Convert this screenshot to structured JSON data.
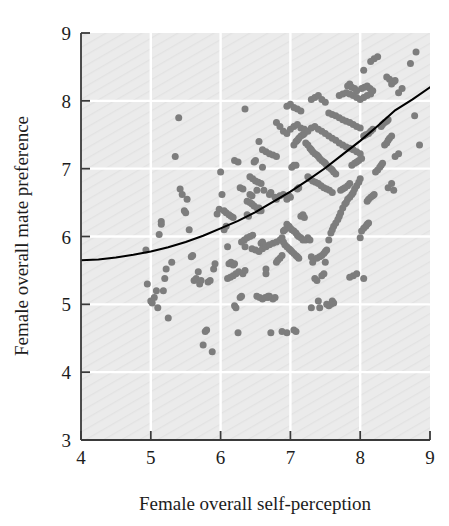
{
  "chart_data": {
    "type": "scatter",
    "title": "",
    "subtitle": "",
    "xlabel": "Female overall self-perception",
    "ylabel": "Female overall mate preference",
    "xlim": [
      4,
      9
    ],
    "ylim": [
      3,
      9
    ],
    "xticks": [
      4,
      5,
      6,
      7,
      8,
      9
    ],
    "yticks": [
      3,
      4,
      5,
      6,
      7,
      8,
      9
    ],
    "xticklabels": [
      "4",
      "5",
      "6",
      "7",
      "8",
      "9"
    ],
    "yticklabels": [
      "3",
      "4",
      "5",
      "6",
      "7",
      "8",
      "9"
    ],
    "grid": true,
    "grid_color": "#ffffff",
    "plot_background": "#ebebeb",
    "legend": null,
    "legend_position": "none",
    "marker_color": "#7d7d7d",
    "marker_size": 7,
    "marker_shape": "circle",
    "fit_line": {
      "name": "quadratic regression fit",
      "color": "#000000",
      "width": 2.1,
      "x": [
        4.0,
        4.25,
        4.5,
        4.75,
        5.0,
        5.25,
        5.5,
        5.75,
        6.0,
        6.25,
        6.5,
        6.75,
        7.0,
        7.25,
        7.5,
        7.75,
        8.0,
        8.25,
        8.5,
        8.75,
        9.0
      ],
      "y": [
        5.65,
        5.66,
        5.69,
        5.73,
        5.78,
        5.84,
        5.92,
        6.01,
        6.12,
        6.23,
        6.36,
        6.51,
        6.66,
        6.83,
        7.01,
        7.21,
        7.41,
        7.63,
        7.86,
        8.02,
        8.2
      ]
    },
    "points": [
      [
        4.93,
        5.8
      ],
      [
        4.95,
        5.3
      ],
      [
        5.0,
        5.05
      ],
      [
        5.02,
        5.02
      ],
      [
        5.05,
        5.1
      ],
      [
        5.08,
        5.2
      ],
      [
        5.1,
        4.95
      ],
      [
        5.12,
        6.03
      ],
      [
        5.15,
        6.22
      ],
      [
        5.15,
        6.18
      ],
      [
        5.18,
        5.2
      ],
      [
        5.2,
        5.38
      ],
      [
        5.22,
        5.52
      ],
      [
        5.25,
        4.8
      ],
      [
        5.3,
        5.62
      ],
      [
        5.35,
        7.18
      ],
      [
        5.4,
        7.75
      ],
      [
        5.42,
        6.7
      ],
      [
        5.45,
        6.62
      ],
      [
        5.48,
        6.38
      ],
      [
        5.5,
        6.35
      ],
      [
        5.52,
        6.55
      ],
      [
        5.55,
        6.1
      ],
      [
        5.58,
        5.7
      ],
      [
        5.6,
        5.72
      ],
      [
        5.62,
        5.35
      ],
      [
        5.65,
        5.38
      ],
      [
        5.68,
        5.48
      ],
      [
        5.7,
        5.3
      ],
      [
        5.72,
        5.35
      ],
      [
        5.75,
        4.4
      ],
      [
        5.78,
        4.6
      ],
      [
        5.8,
        4.62
      ],
      [
        5.82,
        5.33
      ],
      [
        5.85,
        5.35
      ],
      [
        5.88,
        4.3
      ],
      [
        5.9,
        5.52
      ],
      [
        5.92,
        5.6
      ],
      [
        5.95,
        6.33
      ],
      [
        5.98,
        6.4
      ],
      [
        6.0,
        6.95
      ],
      [
        6.02,
        6.62
      ],
      [
        6.05,
        6.1
      ],
      [
        6.08,
        6.15
      ],
      [
        6.1,
        5.85
      ],
      [
        6.12,
        5.6
      ],
      [
        6.15,
        5.62
      ],
      [
        6.18,
        5.58
      ],
      [
        6.2,
        5.6
      ],
      [
        6.2,
        4.98
      ],
      [
        6.22,
        4.95
      ],
      [
        6.25,
        4.58
      ],
      [
        6.28,
        5.1
      ],
      [
        6.3,
        5.12
      ],
      [
        6.32,
        5.45
      ],
      [
        6.35,
        5.5
      ],
      [
        6.35,
        5.85
      ],
      [
        6.38,
        6.32
      ],
      [
        6.4,
        6.3
      ],
      [
        6.42,
        6.62
      ],
      [
        6.45,
        6.6
      ],
      [
        6.48,
        7.1
      ],
      [
        6.5,
        7.12
      ],
      [
        6.52,
        6.68
      ],
      [
        6.55,
        6.38
      ],
      [
        6.55,
        6.42
      ],
      [
        6.58,
        5.9
      ],
      [
        6.6,
        5.92
      ],
      [
        6.62,
        5.88
      ],
      [
        6.65,
        5.52
      ],
      [
        6.65,
        5.45
      ],
      [
        6.68,
        5.1
      ],
      [
        6.7,
        5.12
      ],
      [
        6.72,
        4.58
      ],
      [
        6.75,
        5.08
      ],
      [
        6.78,
        5.1
      ],
      [
        6.8,
        5.62
      ],
      [
        6.82,
        5.65
      ],
      [
        6.85,
        5.68
      ],
      [
        6.88,
        5.72
      ],
      [
        6.9,
        6.08
      ],
      [
        6.92,
        6.1
      ],
      [
        6.95,
        6.55
      ],
      [
        6.98,
        6.6
      ],
      [
        7.0,
        6.58
      ],
      [
        7.02,
        7.02
      ],
      [
        7.05,
        7.05
      ],
      [
        7.08,
        7.05
      ],
      [
        7.1,
        6.7
      ],
      [
        7.12,
        6.72
      ],
      [
        7.15,
        6.3
      ],
      [
        7.18,
        6.32
      ],
      [
        7.2,
        6.28
      ],
      [
        7.22,
        5.95
      ],
      [
        7.25,
        5.98
      ],
      [
        7.28,
        5.95
      ],
      [
        7.3,
        5.7
      ],
      [
        7.32,
        5.62
      ],
      [
        7.35,
        5.38
      ],
      [
        7.38,
        5.35
      ],
      [
        7.4,
        5.05
      ],
      [
        7.42,
        4.95
      ],
      [
        7.45,
        5.42
      ],
      [
        7.48,
        5.45
      ],
      [
        7.5,
        5.62
      ],
      [
        7.52,
        5.8
      ],
      [
        7.55,
        5.95
      ],
      [
        7.58,
        6.05
      ],
      [
        7.6,
        6.1
      ],
      [
        7.62,
        6.15
      ],
      [
        7.65,
        6.2
      ],
      [
        7.68,
        6.25
      ],
      [
        7.7,
        6.3
      ],
      [
        7.72,
        6.35
      ],
      [
        7.75,
        6.42
      ],
      [
        7.78,
        6.48
      ],
      [
        7.8,
        6.5
      ],
      [
        7.82,
        6.55
      ],
      [
        7.85,
        6.58
      ],
      [
        7.88,
        6.62
      ],
      [
        7.9,
        6.65
      ],
      [
        7.92,
        6.7
      ],
      [
        7.95,
        6.75
      ],
      [
        7.98,
        6.8
      ],
      [
        8.0,
        6.85
      ],
      [
        7.05,
        7.35
      ],
      [
        7.08,
        7.4
      ],
      [
        7.1,
        7.42
      ],
      [
        7.12,
        7.45
      ],
      [
        7.15,
        7.48
      ],
      [
        7.18,
        7.5
      ],
      [
        7.2,
        7.52
      ],
      [
        7.22,
        7.38
      ],
      [
        7.25,
        7.35
      ],
      [
        7.28,
        7.3
      ],
      [
        7.3,
        7.28
      ],
      [
        7.32,
        7.25
      ],
      [
        7.35,
        7.22
      ],
      [
        7.38,
        7.2
      ],
      [
        7.4,
        7.18
      ],
      [
        7.42,
        7.15
      ],
      [
        7.45,
        7.12
      ],
      [
        7.48,
        7.1
      ],
      [
        7.5,
        7.08
      ],
      [
        7.52,
        7.05
      ],
      [
        7.55,
        7.02
      ],
      [
        7.58,
        7.0
      ],
      [
        7.6,
        6.98
      ],
      [
        7.62,
        6.95
      ],
      [
        7.65,
        6.92
      ],
      [
        6.8,
        7.68
      ],
      [
        6.85,
        7.62
      ],
      [
        6.9,
        7.55
      ],
      [
        6.95,
        7.52
      ],
      [
        7.0,
        7.58
      ],
      [
        7.05,
        7.62
      ],
      [
        7.1,
        7.65
      ],
      [
        7.15,
        7.6
      ],
      [
        7.2,
        7.58
      ],
      [
        7.25,
        7.55
      ],
      [
        7.3,
        7.6
      ],
      [
        7.35,
        7.62
      ],
      [
        7.4,
        7.58
      ],
      [
        7.45,
        7.55
      ],
      [
        7.5,
        7.52
      ],
      [
        7.55,
        7.48
      ],
      [
        7.6,
        7.45
      ],
      [
        7.65,
        7.42
      ],
      [
        7.7,
        7.38
      ],
      [
        7.75,
        7.35
      ],
      [
        7.8,
        7.32
      ],
      [
        7.85,
        7.3
      ],
      [
        7.9,
        7.28
      ],
      [
        7.95,
        7.25
      ],
      [
        8.0,
        7.22
      ],
      [
        7.55,
        7.82
      ],
      [
        7.6,
        7.8
      ],
      [
        7.65,
        7.78
      ],
      [
        7.7,
        7.75
      ],
      [
        7.75,
        7.72
      ],
      [
        7.8,
        7.7
      ],
      [
        7.85,
        7.68
      ],
      [
        7.9,
        7.65
      ],
      [
        7.95,
        7.62
      ],
      [
        8.0,
        7.6
      ],
      [
        7.7,
        8.08
      ],
      [
        7.75,
        8.1
      ],
      [
        7.8,
        8.12
      ],
      [
        7.85,
        8.1
      ],
      [
        7.9,
        8.08
      ],
      [
        7.95,
        8.05
      ],
      [
        8.0,
        8.02
      ],
      [
        8.05,
        8.05
      ],
      [
        8.1,
        8.08
      ],
      [
        8.15,
        8.1
      ],
      [
        6.35,
        7.88
      ],
      [
        6.55,
        7.4
      ],
      [
        6.6,
        7.02
      ],
      [
        6.62,
        6.68
      ],
      [
        6.7,
        6.62
      ],
      [
        6.72,
        6.65
      ],
      [
        6.78,
        6.58
      ],
      [
        6.8,
        6.55
      ],
      [
        6.85,
        6.6
      ],
      [
        6.9,
        6.62
      ],
      [
        6.2,
        7.12
      ],
      [
        6.25,
        7.1
      ],
      [
        6.28,
        6.72
      ],
      [
        6.32,
        6.7
      ],
      [
        6.38,
        6.52
      ],
      [
        6.42,
        6.5
      ],
      [
        6.45,
        6.48
      ],
      [
        6.48,
        6.45
      ],
      [
        6.52,
        6.42
      ],
      [
        6.58,
        6.38
      ],
      [
        6.05,
        6.38
      ],
      [
        6.08,
        6.35
      ],
      [
        6.12,
        6.32
      ],
      [
        6.15,
        6.3
      ],
      [
        6.18,
        6.28
      ],
      [
        6.9,
        5.92
      ],
      [
        6.92,
        5.88
      ],
      [
        6.95,
        5.85
      ],
      [
        6.98,
        5.82
      ],
      [
        7.0,
        5.8
      ],
      [
        7.02,
        5.78
      ],
      [
        7.05,
        5.75
      ],
      [
        7.08,
        5.72
      ],
      [
        7.1,
        5.7
      ],
      [
        7.12,
        5.68
      ],
      [
        6.95,
        6.18
      ],
      [
        6.98,
        6.15
      ],
      [
        7.0,
        6.12
      ],
      [
        7.02,
        6.1
      ],
      [
        7.05,
        6.08
      ],
      [
        7.08,
        6.05
      ],
      [
        7.1,
        6.02
      ],
      [
        7.12,
        6.0
      ],
      [
        7.15,
        5.98
      ],
      [
        7.18,
        5.95
      ],
      [
        8.02,
        6.08
      ],
      [
        8.05,
        6.12
      ],
      [
        8.08,
        6.15
      ],
      [
        8.1,
        6.18
      ],
      [
        8.12,
        6.2
      ],
      [
        8.0,
        5.98
      ],
      [
        8.05,
        5.38
      ],
      [
        7.9,
        5.42
      ],
      [
        7.85,
        5.4
      ],
      [
        7.95,
        5.45
      ],
      [
        8.1,
        6.52
      ],
      [
        8.12,
        6.55
      ],
      [
        8.15,
        6.58
      ],
      [
        8.18,
        6.6
      ],
      [
        8.2,
        6.62
      ],
      [
        8.22,
        6.95
      ],
      [
        8.25,
        6.98
      ],
      [
        8.28,
        7.02
      ],
      [
        8.3,
        7.05
      ],
      [
        8.32,
        7.08
      ],
      [
        8.35,
        7.35
      ],
      [
        8.38,
        7.38
      ],
      [
        8.4,
        7.42
      ],
      [
        8.42,
        7.45
      ],
      [
        8.45,
        7.48
      ],
      [
        8.3,
        7.62
      ],
      [
        8.32,
        7.65
      ],
      [
        8.35,
        7.68
      ],
      [
        8.38,
        7.7
      ],
      [
        8.4,
        7.72
      ],
      [
        8.45,
        8.25
      ],
      [
        8.48,
        8.28
      ],
      [
        8.5,
        8.3
      ],
      [
        8.42,
        8.32
      ],
      [
        8.38,
        8.35
      ],
      [
        8.2,
        8.62
      ],
      [
        8.25,
        8.65
      ],
      [
        8.15,
        8.58
      ],
      [
        8.05,
        8.45
      ],
      [
        8.8,
        8.72
      ],
      [
        8.72,
        8.55
      ],
      [
        8.78,
        7.78
      ],
      [
        8.85,
        7.35
      ],
      [
        8.6,
        8.18
      ],
      [
        8.55,
        8.12
      ],
      [
        7.3,
        8.02
      ],
      [
        7.35,
        8.05
      ],
      [
        7.4,
        8.08
      ],
      [
        7.45,
        8.02
      ],
      [
        7.5,
        7.98
      ],
      [
        6.95,
        7.92
      ],
      [
        7.0,
        7.95
      ],
      [
        7.05,
        7.9
      ],
      [
        7.1,
        7.88
      ],
      [
        7.15,
        7.85
      ],
      [
        7.82,
        8.22
      ],
      [
        7.85,
        8.25
      ],
      [
        7.88,
        8.2
      ],
      [
        7.92,
        8.18
      ],
      [
        7.95,
        8.15
      ],
      [
        8.02,
        8.18
      ],
      [
        8.06,
        8.2
      ],
      [
        8.1,
        8.22
      ],
      [
        8.14,
        8.18
      ],
      [
        8.18,
        8.15
      ],
      [
        6.45,
        5.82
      ],
      [
        6.5,
        5.8
      ],
      [
        6.55,
        5.78
      ],
      [
        6.6,
        5.82
      ],
      [
        6.65,
        5.85
      ],
      [
        6.7,
        5.88
      ],
      [
        6.75,
        5.9
      ],
      [
        6.8,
        5.92
      ],
      [
        6.85,
        5.95
      ],
      [
        6.88,
        5.98
      ],
      [
        6.3,
        5.92
      ],
      [
        6.34,
        5.95
      ],
      [
        6.38,
        5.98
      ],
      [
        6.42,
        6.0
      ],
      [
        6.46,
        6.02
      ],
      [
        6.1,
        5.38
      ],
      [
        6.14,
        5.4
      ],
      [
        6.18,
        5.42
      ],
      [
        6.22,
        5.45
      ],
      [
        6.26,
        5.48
      ],
      [
        6.52,
        5.12
      ],
      [
        6.56,
        5.1
      ],
      [
        6.6,
        5.08
      ],
      [
        6.64,
        5.1
      ],
      [
        6.68,
        5.12
      ],
      [
        7.6,
        5.05
      ],
      [
        7.62,
        5.02
      ],
      [
        7.58,
        5.0
      ],
      [
        7.55,
        4.98
      ],
      [
        7.52,
        5.0
      ],
      [
        7.3,
        4.95
      ],
      [
        7.05,
        4.62
      ],
      [
        7.08,
        4.6
      ],
      [
        6.95,
        4.58
      ],
      [
        6.88,
        4.6
      ],
      [
        7.72,
        6.68
      ],
      [
        7.75,
        6.7
      ],
      [
        7.78,
        6.72
      ],
      [
        7.82,
        6.75
      ],
      [
        7.85,
        6.78
      ],
      [
        7.88,
        7.05
      ],
      [
        7.92,
        7.08
      ],
      [
        7.95,
        7.1
      ],
      [
        7.98,
        7.12
      ],
      [
        8.02,
        7.15
      ],
      [
        8.05,
        7.48
      ],
      [
        8.08,
        7.5
      ],
      [
        8.12,
        7.52
      ],
      [
        8.15,
        7.55
      ],
      [
        8.18,
        7.58
      ],
      [
        7.25,
        6.88
      ],
      [
        7.28,
        6.85
      ],
      [
        7.32,
        6.82
      ],
      [
        7.36,
        6.8
      ],
      [
        7.4,
        6.78
      ],
      [
        7.44,
        6.75
      ],
      [
        7.48,
        6.72
      ],
      [
        7.52,
        6.7
      ],
      [
        7.56,
        6.68
      ],
      [
        7.6,
        6.65
      ],
      [
        6.6,
        7.28
      ],
      [
        6.65,
        7.25
      ],
      [
        6.7,
        7.22
      ],
      [
        6.75,
        7.2
      ],
      [
        6.8,
        7.18
      ],
      [
        6.42,
        6.88
      ],
      [
        6.46,
        6.85
      ],
      [
        6.5,
        6.82
      ],
      [
        6.54,
        6.8
      ],
      [
        6.58,
        6.78
      ],
      [
        8.4,
        6.72
      ],
      [
        8.45,
        6.78
      ],
      [
        8.5,
        7.18
      ],
      [
        8.55,
        7.22
      ],
      [
        8.48,
        6.68
      ],
      [
        7.45,
        5.72
      ],
      [
        7.48,
        5.75
      ],
      [
        7.5,
        5.78
      ],
      [
        7.42,
        5.7
      ],
      [
        7.38,
        5.68
      ]
    ]
  }
}
